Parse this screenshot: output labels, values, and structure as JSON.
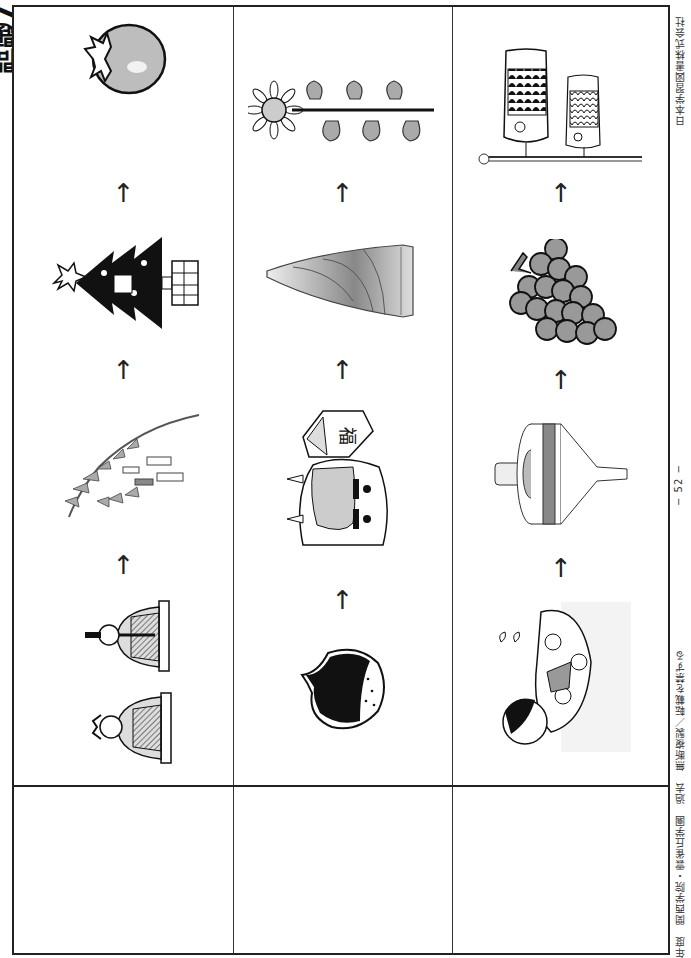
{
  "page": {
    "orientation": "rotated-90-clockwise",
    "title_fragment": "問題7"
  },
  "table": {
    "columns": [
      {
        "id": "col-1",
        "sequence_direction": "bottom-to-top",
        "items": [
          {
            "name": "hina-dolls",
            "label": "ひな人形"
          },
          {
            "name": "tanabata-bamboo",
            "label": "七夕の笹飾り"
          },
          {
            "name": "christmas-tree",
            "label": "クリスマスツリー"
          },
          {
            "name": "persimmon",
            "label": "柿"
          }
        ],
        "arrows": [
          "↑",
          "↑",
          "↑"
        ],
        "answer": ""
      },
      {
        "id": "col-2",
        "sequence_direction": "bottom-to-top",
        "items": [
          {
            "name": "chestnut",
            "label": "栗"
          },
          {
            "name": "oni-mask-with-mame-box",
            "label": "鬼と福豆（節分）"
          },
          {
            "name": "bamboo-shoot",
            "label": "たけのこ"
          },
          {
            "name": "sunflower-and-morning-glory",
            "label": "ひまわり・あさがお"
          }
        ],
        "arrows": [
          "↑",
          "↑",
          "↑"
        ],
        "answer": ""
      },
      {
        "id": "col-3",
        "sequence_direction": "bottom-to-top",
        "items": [
          {
            "name": "girl-with-swim-ring",
            "label": "浮き輪で遊ぶ女の子"
          },
          {
            "name": "spinning-top",
            "label": "こま"
          },
          {
            "name": "grapes",
            "label": "ぶどう"
          },
          {
            "name": "koinobori",
            "label": "こいのぼり"
          }
        ],
        "arrows": [
          "↑",
          "↑",
          "↑"
        ],
        "answer": ""
      }
    ]
  },
  "footer": {
    "publisher": "日本学習図書株式会社",
    "page_number": "− 52 −",
    "meta": "年度　関西学院・雲雀丘学園　過去　無断複製／転載を禁ずる"
  },
  "colors": {
    "ink": "#111111",
    "border": "#222222",
    "gray_fill": "#9a9a9a",
    "light_gray": "#cfcfcf",
    "background": "#ffffff"
  }
}
